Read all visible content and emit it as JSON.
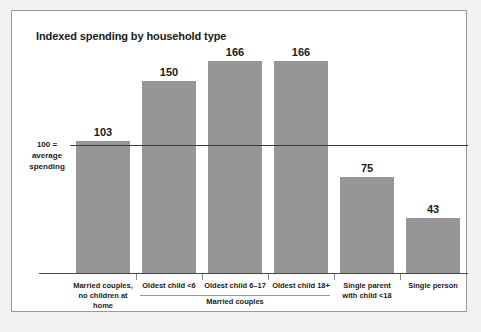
{
  "chart_data": {
    "type": "bar",
    "title": "Indexed spending by household type",
    "xlabel": "",
    "ylabel": "",
    "ylim": [
      0,
      200
    ],
    "grid": false,
    "legend": null,
    "reference_line": {
      "value": 100,
      "label_lines": [
        "100 =",
        "average",
        "spending"
      ]
    },
    "categories": [
      "Married couples, no children at home",
      "Oldest child <6",
      "Oldest child 6–17",
      "Oldest child 18+",
      "Single parent with child <18",
      "Single person"
    ],
    "category_label_lines": [
      [
        "Married couples,",
        "no children at home"
      ],
      [
        "Oldest child <6"
      ],
      [
        "Oldest child 6–17"
      ],
      [
        "Oldest child 18+"
      ],
      [
        "Single parent",
        "with child <18"
      ],
      [
        "Single person"
      ]
    ],
    "values": [
      103,
      150,
      166,
      166,
      75,
      43
    ],
    "value_labels": [
      "103",
      "150",
      "166",
      "166",
      "75",
      "43"
    ],
    "groups": [
      {
        "label": "Married couples",
        "category_indices": [
          1,
          2,
          3
        ]
      }
    ],
    "colors": {
      "bar": "#969696",
      "reference_line": "#3a3a3a",
      "axis": "#4a4a4a",
      "frame": "#9a9a9a",
      "text": "#1a1a1a",
      "background": "#ffffff",
      "page_background": "#f2f2f2"
    }
  }
}
